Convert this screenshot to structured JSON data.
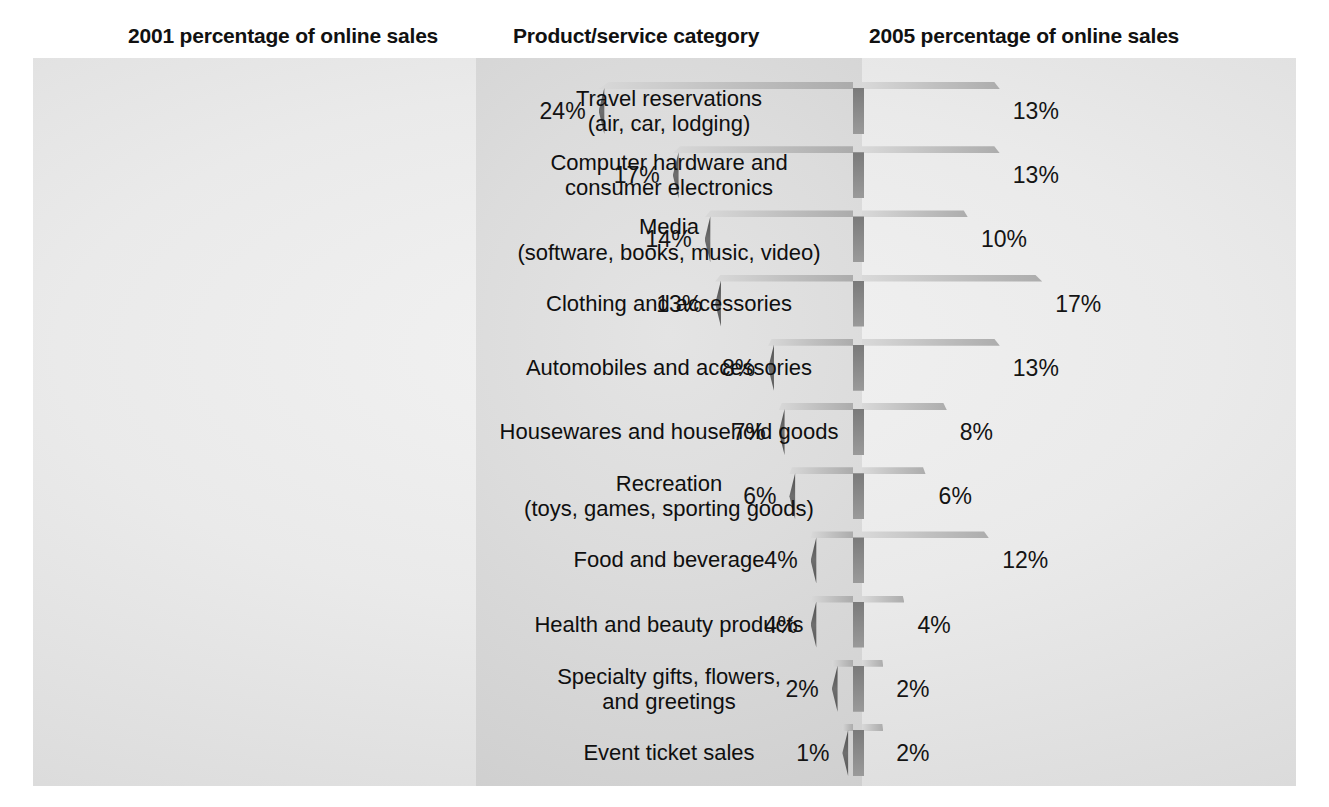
{
  "headers": {
    "left": "2001 percentage of online sales",
    "middle": "Product/service category",
    "right": "2005 percentage of online sales"
  },
  "colors": {
    "page_background": "#ffffff",
    "panel_background": "#e4e4e4",
    "center_band": "#dcdcdc",
    "text": "#111111",
    "bar_dark": "#6f6f6f",
    "bar_medium": "#9a9a9a",
    "bar_light": "#c9c9c9"
  },
  "chart_data": {
    "type": "bar",
    "xlabel": "",
    "ylabel": "Product/service category",
    "orientation": "horizontal-tornado",
    "grid": false,
    "legend_position": "none",
    "value_unit": "%",
    "xlim": [
      0,
      24
    ],
    "categories": [
      "Travel reservations\n(air, car, lodging)",
      "Computer hardware and\nconsumer electronics",
      "Media\n(software, books, music, video)",
      "Clothing and accessories",
      "Automobiles and accessories",
      "Housewares and household goods",
      "Recreation\n(toys, games, sporting goods)",
      "Food and beverage",
      "Health and beauty products",
      "Specialty gifts, flowers,\nand greetings",
      "Event ticket sales"
    ],
    "series": [
      {
        "name": "2001 percentage of online sales",
        "side": "left",
        "values": [
          24,
          17,
          14,
          13,
          8,
          7,
          6,
          4,
          4,
          2,
          1
        ],
        "labels": [
          "24%",
          "17%",
          "14%",
          "13%",
          "8%",
          "7%",
          "6%",
          "4%",
          "4%",
          "2%",
          "1%"
        ]
      },
      {
        "name": "2005 percentage of online sales",
        "side": "right",
        "values": [
          13,
          13,
          10,
          17,
          13,
          8,
          6,
          12,
          4,
          2,
          2
        ],
        "labels": [
          "13%",
          "13%",
          "10%",
          "17%",
          "13%",
          "8%",
          "6%",
          "12%",
          "4%",
          "2%",
          "2%"
        ]
      }
    ],
    "rows": [
      {
        "category": "Travel reservations\n(air, car, lodging)",
        "left": 24,
        "left_label": "24%",
        "right": 13,
        "right_label": "13%",
        "tone": "dark"
      },
      {
        "category": "Computer hardware and\nconsumer electronics",
        "left": 17,
        "left_label": "17%",
        "right": 13,
        "right_label": "13%",
        "tone": "medium"
      },
      {
        "category": "Media\n(software, books, music, video)",
        "left": 14,
        "left_label": "14%",
        "right": 10,
        "right_label": "10%",
        "tone": "light"
      },
      {
        "category": "Clothing and accessories",
        "left": 13,
        "left_label": "13%",
        "right": 17,
        "right_label": "17%",
        "tone": "dark"
      },
      {
        "category": "Automobiles and accessories",
        "left": 8,
        "left_label": "8%",
        "right": 13,
        "right_label": "13%",
        "tone": "medium"
      },
      {
        "category": "Housewares and household goods",
        "left": 7,
        "left_label": "7%",
        "right": 8,
        "right_label": "8%",
        "tone": "dark"
      },
      {
        "category": "Recreation\n(toys, games, sporting goods)",
        "left": 6,
        "left_label": "6%",
        "right": 6,
        "right_label": "6%",
        "tone": "medium"
      },
      {
        "category": "Food and beverage",
        "left": 4,
        "left_label": "4%",
        "right": 12,
        "right_label": "12%",
        "tone": "light"
      },
      {
        "category": "Health and beauty products",
        "left": 4,
        "left_label": "4%",
        "right": 4,
        "right_label": "4%",
        "tone": "dark"
      },
      {
        "category": "Specialty gifts, flowers,\nand greetings",
        "left": 2,
        "left_label": "2%",
        "right": 2,
        "right_label": "2%",
        "tone": "medium"
      },
      {
        "category": "Event ticket sales",
        "left": 1,
        "left_label": "1%",
        "right": 2,
        "right_label": "2%",
        "tone": "dark"
      }
    ]
  }
}
